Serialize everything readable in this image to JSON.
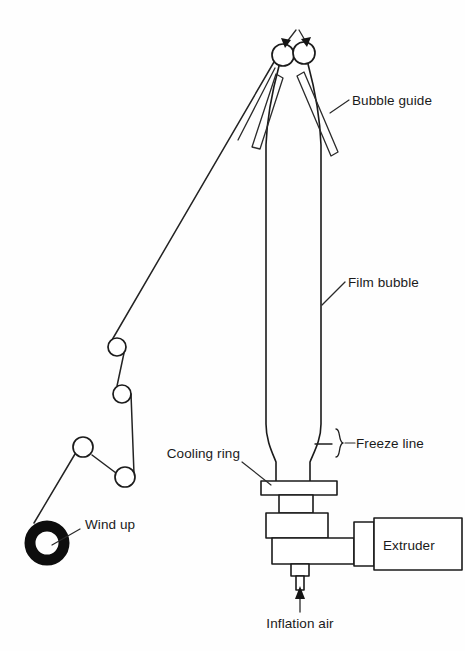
{
  "diagram": {
    "background_color": "#fefefe",
    "line_color": "#1b1b1b",
    "labels": {
      "bubble_guide": "Bubble guide",
      "film_bubble": "Film bubble",
      "freeze_line": "Freeze line",
      "cooling_ring": "Cooling ring",
      "wind_up": "Wind up",
      "extruder": "Extruder",
      "inflation_air": "Inflation air"
    },
    "components": [
      {
        "name": "nip-roller-left",
        "label": "Nip roller (left)",
        "cx": 283,
        "cy": 55,
        "r": 11
      },
      {
        "name": "nip-roller-right",
        "label": "Nip roller (right)",
        "cx": 304,
        "cy": 53,
        "r": 11
      },
      {
        "name": "idler-roller-1",
        "label": "Idler roller 1",
        "cx": 117,
        "cy": 347,
        "r": 9
      },
      {
        "name": "idler-roller-2",
        "label": "Idler roller 2",
        "cx": 122,
        "cy": 394,
        "r": 9
      },
      {
        "name": "idler-roller-3",
        "label": "Idler roller 3",
        "cx": 83,
        "cy": 447,
        "r": 10
      },
      {
        "name": "idler-roller-4",
        "label": "Idler roller 4",
        "cx": 125,
        "cy": 477,
        "r": 10
      },
      {
        "name": "wind-up-roll",
        "label": "Wind up roll",
        "cx": 47,
        "cy": 543,
        "r": 17
      }
    ],
    "flow_arrows": [
      {
        "name": "nip-arrow-left",
        "direction": "down-right"
      },
      {
        "name": "nip-arrow-right",
        "direction": "down-left"
      },
      {
        "name": "inflation-air-arrow",
        "direction": "up"
      }
    ]
  }
}
